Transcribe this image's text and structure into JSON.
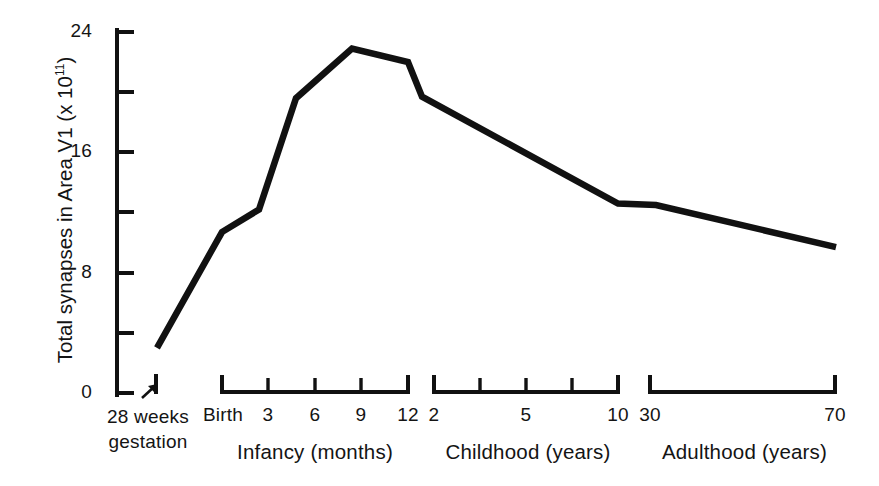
{
  "chart_data": {
    "type": "line",
    "title": "",
    "xlabel": "",
    "ylabel": "Total synapses in Area V1 (x 10^11)",
    "ylabel_prefix": "Total synapses in Area V1 (x 10",
    "ylabel_exponent": "11",
    "ylabel_suffix": ")",
    "ylim": [
      0,
      24
    ],
    "ytick_values": [
      0,
      4,
      8,
      12,
      16,
      20,
      24
    ],
    "ytick_labels_shown": [
      "0",
      "8",
      "16",
      "24"
    ],
    "grid": false,
    "legend": null,
    "line_color": "#111111",
    "background_color": "#ffffff",
    "x_is_nonlinear_piecewise": true,
    "annotation": {
      "text_line1": "28 weeks",
      "text_line2": "gestation",
      "marker": "arrow-up-right",
      "points_to": "28 weeks gestation tick"
    },
    "x_segments": [
      {
        "name": "Gestation",
        "caption": "",
        "tick_labels": [
          "28 weeks gestation"
        ]
      },
      {
        "name": "Infancy",
        "caption": "Infancy (months)",
        "tick_labels": [
          "Birth",
          "3",
          "6",
          "9",
          "12"
        ]
      },
      {
        "name": "Childhood",
        "caption": "Childhood (years)",
        "tick_labels": [
          "2",
          "5",
          "10"
        ]
      },
      {
        "name": "Adulthood",
        "caption": "Adulthood (years)",
        "tick_labels": [
          "30",
          "70"
        ]
      }
    ],
    "points": [
      {
        "x_label": "28 weeks gestation",
        "y": 3.0
      },
      {
        "x_label": "Birth",
        "y": 10.7
      },
      {
        "x_label": "1.5 months",
        "y": 12.2
      },
      {
        "x_label": "5 months",
        "y": 19.6
      },
      {
        "x_label": "9 months",
        "y": 22.9
      },
      {
        "x_label": "11.5 months",
        "y": 22.0
      },
      {
        "x_label": "12 months",
        "y": 19.7
      },
      {
        "x_label": "10 years",
        "y": 12.6
      },
      {
        "x_label": "30 years",
        "y": 12.5
      },
      {
        "x_label": "70 years",
        "y": 9.7
      }
    ],
    "values": [
      3.0,
      10.7,
      12.2,
      19.6,
      22.9,
      22.0,
      19.7,
      12.6,
      12.5,
      9.7
    ]
  },
  "axis": {
    "y_ticks": [
      {
        "label": "24",
        "show": true
      },
      {
        "label": "",
        "show": false
      },
      {
        "label": "16",
        "show": true
      },
      {
        "label": "",
        "show": false
      },
      {
        "label": "8",
        "show": true
      },
      {
        "label": "",
        "show": false
      },
      {
        "label": "0",
        "show": true
      }
    ],
    "y_labels": {
      "t24": "24",
      "t16": "16",
      "t8": "8",
      "t0": "0"
    },
    "x_labels": {
      "birth": "Birth",
      "m3": "3",
      "m6": "6",
      "m9": "9",
      "m12": "12",
      "y2": "2",
      "y5": "5",
      "y10": "10",
      "y30": "30",
      "y70": "70"
    }
  },
  "annotation": {
    "line1": "28 weeks",
    "line2": "gestation"
  },
  "captions": {
    "infancy": "Infancy (months)",
    "childhood": "Childhood (years)",
    "adulthood": "Adulthood (years)"
  },
  "ylabel": {
    "prefix": "Total synapses in Area V1 (x 10",
    "exponent": "11",
    "suffix": ")"
  }
}
